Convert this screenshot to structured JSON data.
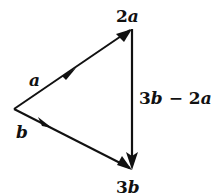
{
  "diagram": {
    "type": "vector-triangle",
    "vertices": {
      "origin": {
        "x": 14,
        "y": 109
      },
      "top": {
        "x": 132,
        "y": 29
      },
      "bottom": {
        "x": 132,
        "y": 170
      }
    },
    "edges": [
      {
        "from": "origin",
        "to": "top",
        "label": "a",
        "mid_arrow": true,
        "end_arrow": true
      },
      {
        "from": "origin",
        "to": "bottom",
        "label": "b",
        "mid_arrow": true,
        "end_arrow": true
      },
      {
        "from": "top",
        "to": "bottom",
        "label": "3b − 2a",
        "mid_arrow": false,
        "end_arrow": true
      }
    ],
    "labels": {
      "top_vertex": "2a",
      "bottom_vertex": "3b",
      "edge_a": "a",
      "edge_b": "b",
      "edge_right": "3b − 2a",
      "top_vertex_num": "2",
      "top_vertex_var": "a",
      "bottom_vertex_num": "3",
      "bottom_vertex_var": "b",
      "right_num1": "3",
      "right_var1": "b",
      "right_op": " − ",
      "right_num2": "2",
      "right_var2": "a"
    },
    "colors": {
      "stroke": "#111111",
      "background": "#ffffff"
    }
  }
}
